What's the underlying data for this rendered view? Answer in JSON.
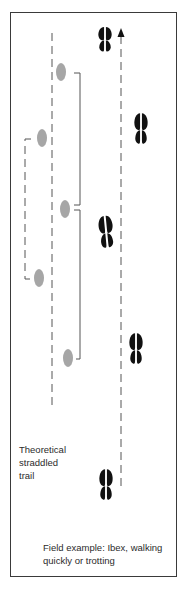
{
  "figure": {
    "theoretical_caption": "Theoretical\nstraddled\n trail",
    "field_caption": "Field example: Ibex, walking\nquickly or trotting",
    "colors": {
      "frame": "#3a3a3a",
      "theoretical_print": "#a6a6a6",
      "field_print": "#111111",
      "guide_line": "#555555",
      "text": "#2b2b2b"
    },
    "theoretical_prints": [
      {
        "x": 61,
        "y": 72
      },
      {
        "x": 42,
        "y": 138
      },
      {
        "x": 65,
        "y": 209
      },
      {
        "x": 39,
        "y": 278
      },
      {
        "x": 68,
        "y": 358
      }
    ],
    "field_prints": [
      {
        "x": 105,
        "y": 38
      },
      {
        "x": 141,
        "y": 127
      },
      {
        "x": 106,
        "y": 230
      },
      {
        "x": 136,
        "y": 347
      },
      {
        "x": 106,
        "y": 483
      }
    ],
    "direction_icon": "arrow-up-icon"
  }
}
